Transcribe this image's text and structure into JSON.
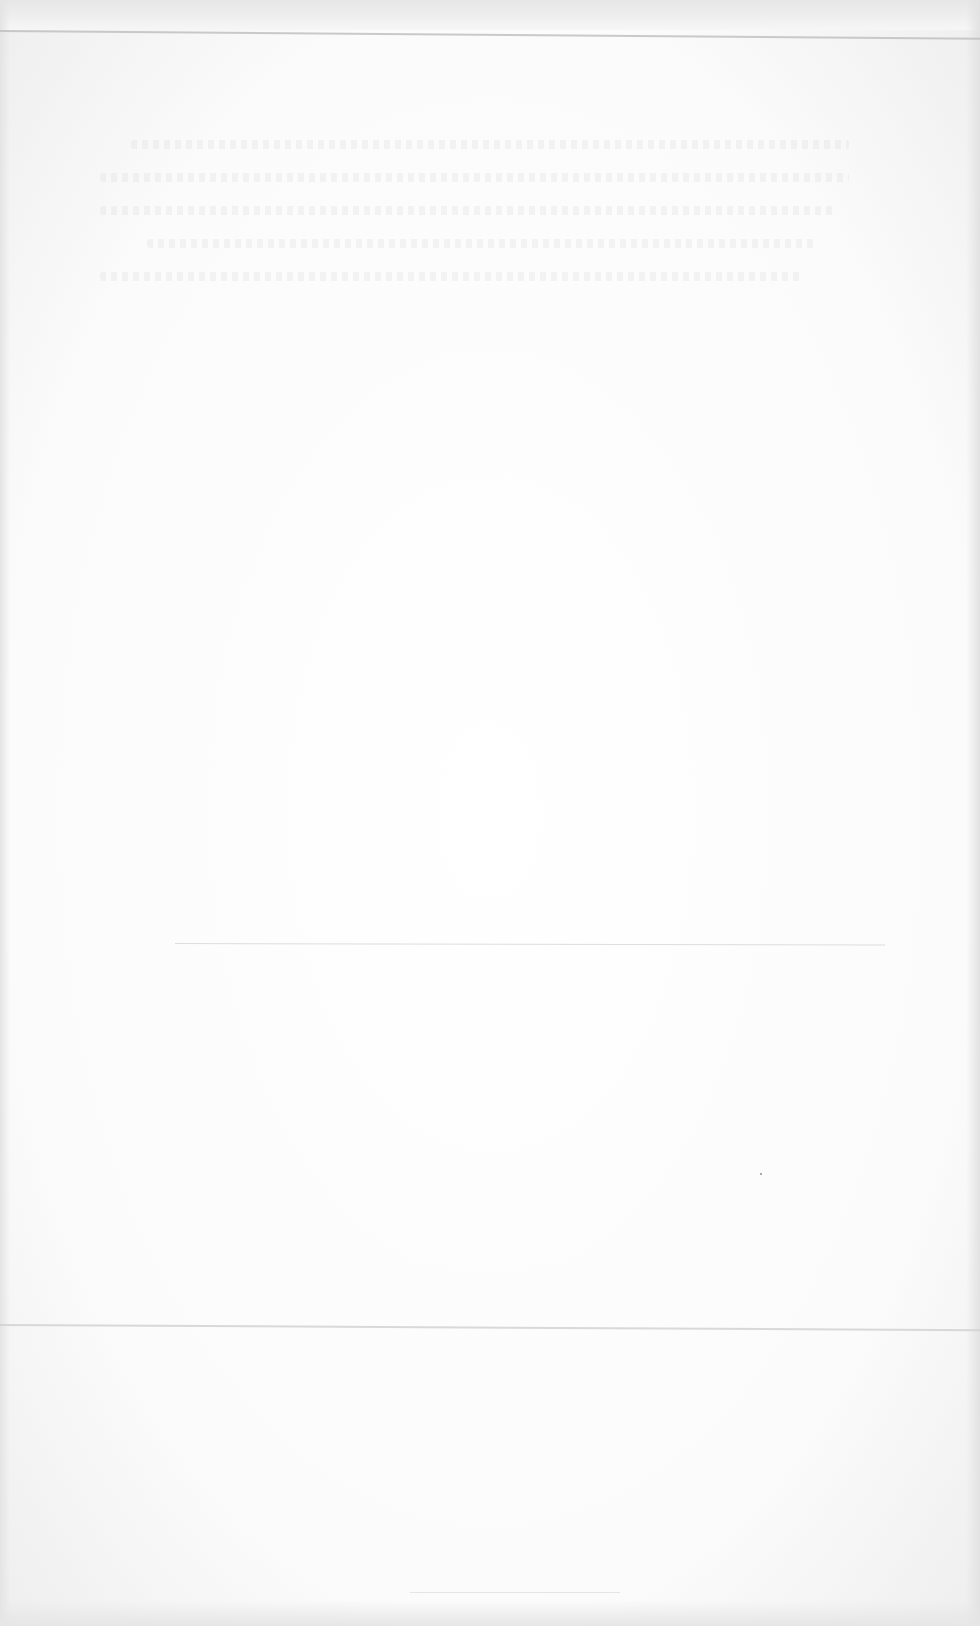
{
  "document": {
    "type": "scanned-blank-page",
    "legible_text": [],
    "faint_text_rows": 5,
    "fold_lines": 4,
    "paper_color": "#ffffff",
    "edge_shadow_color": "#e4e4e4",
    "fold_line_color": "#cfcfcf"
  }
}
